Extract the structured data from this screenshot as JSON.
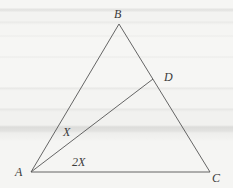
{
  "diagram": {
    "type": "geometry-triangle",
    "points": {
      "A": {
        "label": "A",
        "x": 31,
        "y": 172
      },
      "B": {
        "label": "B",
        "x": 119,
        "y": 24
      },
      "C": {
        "label": "C",
        "x": 210,
        "y": 172
      },
      "D": {
        "label": "D",
        "x": 153,
        "y": 79
      }
    },
    "segments": [
      {
        "from": "A",
        "to": "B"
      },
      {
        "from": "B",
        "to": "C"
      },
      {
        "from": "A",
        "to": "C"
      },
      {
        "from": "A",
        "to": "D"
      }
    ],
    "angles": {
      "BAD": {
        "label": "X"
      },
      "DAC": {
        "label": "2X"
      }
    },
    "colors": {
      "line": "#555555",
      "text": "#3a3a3a",
      "background": "#f4f4f2"
    }
  }
}
